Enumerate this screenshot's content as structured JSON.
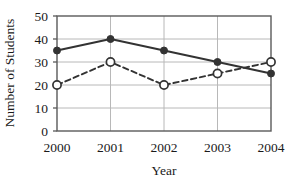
{
  "chart_data": {
    "type": "line",
    "title": "",
    "xlabel": "Year",
    "ylabel": "Number of Students",
    "categories": [
      "2000",
      "2001",
      "2002",
      "2003",
      "2004"
    ],
    "x": [
      2000,
      2001,
      2002,
      2003,
      2004
    ],
    "ylim": [
      0,
      50
    ],
    "ytick_values": [
      0,
      10,
      20,
      30,
      40,
      50
    ],
    "ytick_labels": [
      "0",
      "10",
      "20",
      "30",
      "40",
      "50"
    ],
    "grid": "both",
    "legend": "none",
    "series": [
      {
        "name": "series-solid",
        "values": [
          35,
          40,
          35,
          30,
          25
        ],
        "line_style": "solid",
        "marker": "filled-circle",
        "color": "#333333"
      },
      {
        "name": "series-dashed",
        "values": [
          20,
          30,
          20,
          25,
          30
        ],
        "line_style": "dashed",
        "marker": "open-circle",
        "color": "#333333"
      }
    ],
    "colors": {
      "axis": "#555555",
      "grid": "#b3b3b3",
      "line": "#333333",
      "marker_fill_open": "#ffffff",
      "background": "#ffffff"
    }
  },
  "axes": {
    "y_title": "Number of Students",
    "x_title": "Year",
    "y_ticks": [
      {
        "label": "50"
      },
      {
        "label": "40"
      },
      {
        "label": "30"
      },
      {
        "label": "20"
      },
      {
        "label": "10"
      },
      {
        "label": "0"
      }
    ],
    "x_ticks": [
      {
        "label": "2000"
      },
      {
        "label": "2001"
      },
      {
        "label": "2002"
      },
      {
        "label": "2003"
      },
      {
        "label": "2004"
      }
    ]
  }
}
